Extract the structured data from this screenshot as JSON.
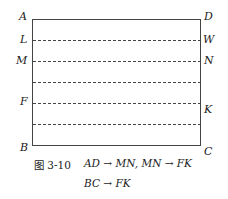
{
  "figure": {
    "caption_number": "图 3-10",
    "caption_line1": "AD → MN,  MN → FK",
    "caption_line2": "BC → FK"
  },
  "points": {
    "A": "A",
    "D": "D",
    "L": "L",
    "W": "W",
    "M": "M",
    "N": "N",
    "F": "F",
    "K": "K",
    "B": "B",
    "C": "C"
  },
  "rectangle": {
    "x": 32,
    "y": 19,
    "width": 168,
    "height": 126,
    "stroke": "#444444"
  },
  "dashed_lines_y": [
    40,
    61,
    82,
    103,
    124
  ]
}
